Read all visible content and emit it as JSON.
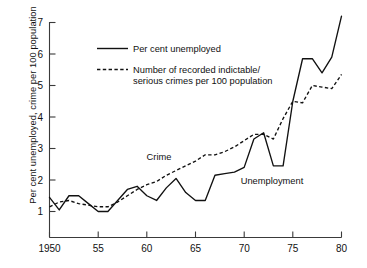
{
  "chart_data": {
    "type": "line",
    "title": "",
    "xlabel": "",
    "ylabel": "Per cent unemployed, crime per 100 population",
    "xlim": [
      1950,
      1980
    ],
    "ylim": [
      0.45,
      7.4
    ],
    "grid": false,
    "legend_position": "top-left-inside",
    "xticks": [
      1950,
      1955,
      1960,
      1965,
      1970,
      1975,
      1980
    ],
    "xticklabels": [
      "1950",
      "55",
      "60",
      "65",
      "70",
      "75",
      "80"
    ],
    "yticks": [
      1,
      2,
      3,
      4,
      5,
      6,
      7
    ],
    "yticklabels": [
      "1",
      "2",
      "3",
      "4",
      "5",
      "6",
      "7"
    ],
    "x": [
      1950,
      1951,
      1952,
      1953,
      1954,
      1955,
      1956,
      1957,
      1958,
      1959,
      1960,
      1961,
      1962,
      1963,
      1964,
      1965,
      1966,
      1967,
      1968,
      1969,
      1970,
      1971,
      1972,
      1973,
      1974,
      1975,
      1976,
      1977,
      1978,
      1979,
      1980
    ],
    "series": [
      {
        "name": "Per cent unemployed",
        "style": "solid",
        "label_in_plot": "Unemployment",
        "values": [
          1.45,
          1.05,
          1.5,
          1.5,
          1.25,
          1.0,
          1.0,
          1.35,
          1.7,
          1.8,
          1.5,
          1.35,
          1.75,
          2.05,
          1.6,
          1.35,
          1.35,
          2.15,
          2.2,
          2.25,
          2.4,
          3.3,
          3.5,
          2.45,
          2.45,
          4.5,
          5.85,
          5.85,
          5.4,
          5.9,
          7.2
        ]
      },
      {
        "name": "Number of recorded indictable/ serious crimes per 100 population",
        "style": "dashed",
        "label_in_plot": "Crime",
        "values": [
          1.15,
          1.3,
          1.35,
          1.25,
          1.2,
          1.15,
          1.15,
          1.3,
          1.5,
          1.7,
          1.85,
          1.95,
          2.15,
          2.3,
          2.45,
          2.6,
          2.8,
          2.8,
          2.9,
          3.05,
          3.25,
          3.45,
          3.45,
          3.3,
          3.95,
          4.5,
          4.45,
          5.0,
          4.95,
          4.9,
          5.35
        ]
      }
    ],
    "legend": [
      {
        "label": "Per cent unemployed",
        "style": "solid"
      },
      {
        "label": "Number of recorded indictable/",
        "label2": "serious crimes per 100 population",
        "style": "dashed"
      }
    ],
    "annotations": [
      {
        "text": "Crime",
        "x": 1963.2,
        "y": 2.52
      },
      {
        "text": "Unemployment",
        "x": 1968.8,
        "y": 1.78
      }
    ]
  }
}
